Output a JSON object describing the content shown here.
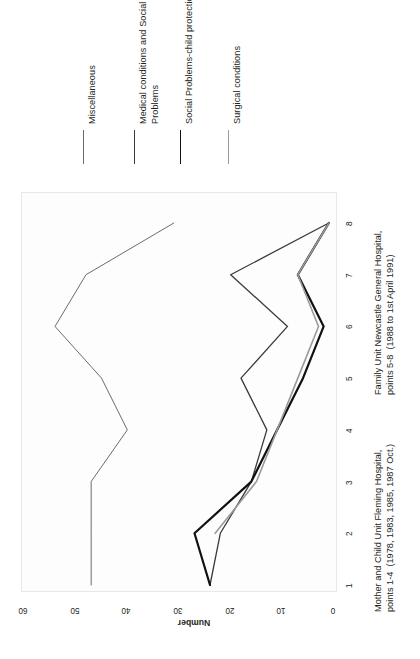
{
  "chart_data": {
    "type": "line",
    "title": "",
    "xlabel": "",
    "ylabel": "Number",
    "x": [
      1,
      2,
      3,
      4,
      5,
      6,
      7,
      8
    ],
    "xticklabels": [
      "1",
      "2",
      "3",
      "4",
      "5",
      "6",
      "7",
      "8"
    ],
    "yticklabels": [
      "0",
      "10",
      "20",
      "30",
      "40",
      "50",
      "60"
    ],
    "yticks": [
      0,
      10,
      20,
      30,
      40,
      50,
      60
    ],
    "ylim": [
      0,
      60
    ],
    "xlim": [
      1,
      8
    ],
    "grid": false,
    "legend_position": "above-plot-rotated",
    "orientation": "rotated-90-ccw",
    "series": [
      {
        "name": "Miscellaneous",
        "color": "#6b6b6b",
        "width": 1.0,
        "x": [
          1,
          2,
          3,
          4,
          5,
          6,
          7,
          8
        ],
        "values": [
          47,
          47,
          47,
          40,
          45,
          54,
          48,
          31
        ]
      },
      {
        "name": "Medical conditions and Social Problems",
        "color": "#3a3a3a",
        "width": 1.3,
        "x": [
          1,
          2,
          3,
          4,
          5,
          6,
          7,
          8
        ],
        "values": [
          24,
          22,
          16,
          13,
          18,
          9,
          20,
          1
        ]
      },
      {
        "name": "Social Problems-child protection",
        "color": "#111111",
        "width": 2.2,
        "x": [
          1,
          2,
          3,
          4,
          5,
          6,
          7,
          8
        ],
        "values": [
          24,
          27,
          16,
          11,
          6,
          2,
          7,
          1
        ]
      },
      {
        "name": "Surgical conditions",
        "color": "#9a9a9a",
        "width": 1.6,
        "x": [
          2,
          3,
          4,
          5,
          6,
          7,
          8
        ],
        "values": [
          23,
          15,
          11,
          7,
          3,
          7,
          1
        ]
      }
    ]
  },
  "legend": {
    "entries": [
      {
        "label": "Miscellaneous",
        "color": "#6b6b6b",
        "width": 1.4
      },
      {
        "label": "Medical conditions and Social\nProblems",
        "color": "#3a3a3a",
        "width": 1.4
      },
      {
        "label": "Social Problems-child protection",
        "color": "#111111",
        "width": 1.4
      },
      {
        "label": "Surgical conditions",
        "color": "#9a9a9a",
        "width": 1.4
      }
    ]
  },
  "captions": {
    "left": "Mother and Child Unit Fleming Hospital,\npoints 1-4  (1978, 1983, 1985, 1987 Oct.)",
    "right": "Family Unit Newcastle General Hospital,\npoints 5-8  (1988 to 1st April 1991)"
  }
}
